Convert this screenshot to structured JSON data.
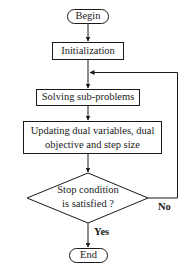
{
  "diagram": {
    "type": "flowchart",
    "nodes": [
      {
        "id": "begin",
        "shape": "terminator",
        "label": "Begin"
      },
      {
        "id": "init",
        "shape": "process",
        "label": "Initialization"
      },
      {
        "id": "solve",
        "shape": "process",
        "label": "Solving sub-problems"
      },
      {
        "id": "update",
        "shape": "process",
        "label_line1": "Updating dual variables, dual",
        "label_line2": "objective and step size"
      },
      {
        "id": "stop",
        "shape": "decision",
        "label_line1": "Stop condition",
        "label_line2": "is satisfied ?"
      },
      {
        "id": "end",
        "shape": "terminator",
        "label": "End"
      }
    ],
    "edges": [
      {
        "from": "begin",
        "to": "init",
        "label": ""
      },
      {
        "from": "init",
        "to": "solve",
        "label": ""
      },
      {
        "from": "solve",
        "to": "update",
        "label": ""
      },
      {
        "from": "update",
        "to": "stop",
        "label": ""
      },
      {
        "from": "stop",
        "to": "end",
        "label": "Yes"
      },
      {
        "from": "stop",
        "to": "solve",
        "label": "No"
      }
    ],
    "stroke_color": "#1a1a1a",
    "background_color": "#ffffff"
  }
}
